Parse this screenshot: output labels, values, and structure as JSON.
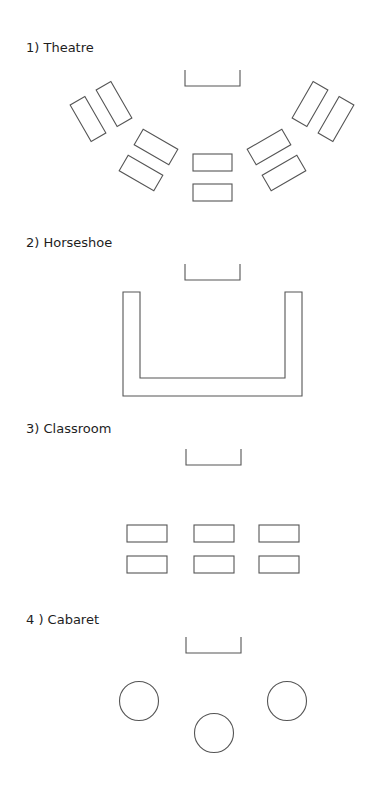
{
  "sections": [
    {
      "id": "theatre",
      "label": "1) Theatre",
      "label_y": 40
    },
    {
      "id": "horseshoe",
      "label": "2) Horseshoe",
      "label_y": 235
    },
    {
      "id": "classroom",
      "label": "3) Classroom",
      "label_y": 421
    },
    {
      "id": "cabaret",
      "label": "4 ) Cabaret",
      "label_y": 612
    }
  ],
  "colors": {
    "stroke": "#555555",
    "text": "#1e1e1e",
    "background": "#ffffff"
  }
}
